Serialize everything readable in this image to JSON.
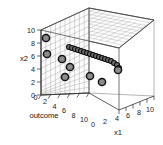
{
  "figure": {
    "type": "3d-scatter",
    "background_color": "#ffffff",
    "box_color": "#3a3a3a",
    "grid_color": "#9a9a9a",
    "point_fill": "#8c8c8c",
    "point_edge": "#141414"
  },
  "axes": {
    "x1": {
      "title": "x1",
      "ticks": [
        "0",
        "2",
        "4",
        "6",
        "8",
        "10"
      ],
      "range": [
        0,
        10
      ]
    },
    "x2": {
      "title": "x2",
      "ticks": [
        "10",
        "8",
        "6",
        "4",
        "2",
        "0"
      ],
      "range": [
        0,
        10
      ]
    },
    "outcome": {
      "title": "outcome",
      "ticks": [
        "0",
        "2",
        "4",
        "6",
        "8",
        "10"
      ],
      "range": [
        0,
        10
      ]
    }
  },
  "chart_data": {
    "type": "scatter",
    "title": "",
    "xlabel": "x1",
    "ylabel": "outcome",
    "zlabel": "x2",
    "xlim": [
      0,
      10
    ],
    "ylim": [
      0,
      10
    ],
    "zlim": [
      0,
      10
    ],
    "grid": true,
    "legend": null,
    "series": [
      {
        "name": "large-markers",
        "marker": "circle-large",
        "points": [
          {
            "x1": 0.4,
            "outcome": 0.5,
            "x2": 7.3
          },
          {
            "x1": 0.5,
            "outcome": 0.6,
            "x2": 4.9
          },
          {
            "x1": 2.1,
            "outcome": 1.4,
            "x2": 4.2
          },
          {
            "x1": 3.0,
            "outcome": 2.1,
            "x2": 3.3
          },
          {
            "x1": 2.4,
            "outcome": 1.7,
            "x2": 1.9
          },
          {
            "x1": 5.6,
            "outcome": 3.6,
            "x2": 2.1
          },
          {
            "x1": 4.6,
            "outcome": 3.2,
            "x2": 1.3
          },
          {
            "x1": 7.4,
            "outcome": 4.8,
            "x2": 3.0
          }
        ]
      },
      {
        "name": "curve-markers",
        "marker": "circle-small",
        "points": [
          {
            "x1": 3.3,
            "outcome": 2.2,
            "x2": 5.9
          },
          {
            "x1": 3.6,
            "outcome": 2.4,
            "x2": 5.8
          },
          {
            "x1": 3.9,
            "outcome": 2.6,
            "x2": 5.7
          },
          {
            "x1": 4.2,
            "outcome": 2.8,
            "x2": 5.6
          },
          {
            "x1": 4.5,
            "outcome": 3.0,
            "x2": 5.4
          },
          {
            "x1": 4.8,
            "outcome": 3.2,
            "x2": 5.3
          },
          {
            "x1": 5.1,
            "outcome": 3.4,
            "x2": 5.1
          },
          {
            "x1": 5.4,
            "outcome": 3.6,
            "x2": 5.0
          },
          {
            "x1": 5.7,
            "outcome": 3.8,
            "x2": 4.8
          },
          {
            "x1": 6.0,
            "outcome": 4.0,
            "x2": 4.6
          },
          {
            "x1": 6.3,
            "outcome": 4.2,
            "x2": 4.5
          },
          {
            "x1": 6.6,
            "outcome": 4.4,
            "x2": 4.3
          },
          {
            "x1": 6.9,
            "outcome": 4.6,
            "x2": 4.1
          },
          {
            "x1": 7.2,
            "outcome": 4.8,
            "x2": 3.9
          },
          {
            "x1": 7.5,
            "outcome": 5.0,
            "x2": 3.7
          },
          {
            "x1": 7.8,
            "outcome": 5.2,
            "x2": 3.5
          },
          {
            "x1": 8.1,
            "outcome": 5.4,
            "x2": 3.3
          },
          {
            "x1": 8.4,
            "outcome": 5.6,
            "x2": 3.1
          }
        ]
      }
    ]
  },
  "rendered": {
    "x2_ticks": [
      {
        "label": "10",
        "x": 36,
        "y": 17
      },
      {
        "label": "8",
        "x": 41,
        "y": 32
      },
      {
        "label": "6",
        "x": 41,
        "y": 47
      },
      {
        "label": "4",
        "x": 41,
        "y": 62
      },
      {
        "label": "2",
        "x": 41,
        "y": 77
      },
      {
        "label": "0",
        "x": 41,
        "y": 92
      }
    ],
    "x2_title": {
      "label": "x2",
      "x": 25,
      "y": 58
    },
    "outcome_ticks": [
      {
        "label": "0",
        "x": 34,
        "y": 95
      },
      {
        "label": "2",
        "x": 43,
        "y": 100
      },
      {
        "label": "4",
        "x": 53,
        "y": 106
      },
      {
        "label": "6",
        "x": 63,
        "y": 112
      },
      {
        "label": "8",
        "x": 73,
        "y": 118
      },
      {
        "label": "10",
        "x": 81,
        "y": 124
      }
    ],
    "outcome_title": {
      "label": "outcome",
      "x": 26,
      "y": 117
    },
    "x1_ticks": [
      {
        "label": "0",
        "x": 91,
        "y": 127
      },
      {
        "label": "2",
        "x": 103,
        "y": 124
      },
      {
        "label": "4",
        "x": 115,
        "y": 121
      },
      {
        "label": "6",
        "x": 127,
        "y": 118
      },
      {
        "label": "8",
        "x": 138,
        "y": 115
      },
      {
        "label": "10",
        "x": 148,
        "y": 112
      }
    ],
    "x1_title": {
      "label": "x1",
      "x": 117,
      "y": 134
    },
    "big_points": [
      {
        "cx": 46,
        "cy": 38,
        "r": 3.6
      },
      {
        "cx": 47,
        "cy": 54,
        "r": 3.6
      },
      {
        "cx": 62,
        "cy": 59,
        "r": 3.6
      },
      {
        "cx": 70,
        "cy": 67,
        "r": 3.6
      },
      {
        "cx": 65,
        "cy": 77,
        "r": 3.6
      },
      {
        "cx": 90,
        "cy": 76,
        "r": 3.6
      },
      {
        "cx": 102,
        "cy": 82,
        "r": 3.6
      },
      {
        "cx": 118,
        "cy": 70,
        "r": 3.6
      }
    ],
    "curve_points": [
      {
        "cx": 69,
        "cy": 47,
        "r": 2.5
      },
      {
        "cx": 72,
        "cy": 48,
        "r": 2.5
      },
      {
        "cx": 75,
        "cy": 49,
        "r": 2.5
      },
      {
        "cx": 78,
        "cy": 50,
        "r": 2.5
      },
      {
        "cx": 81,
        "cy": 51,
        "r": 2.5
      },
      {
        "cx": 84,
        "cy": 52,
        "r": 2.5
      },
      {
        "cx": 87,
        "cy": 53,
        "r": 2.5
      },
      {
        "cx": 90,
        "cy": 54,
        "r": 2.5
      },
      {
        "cx": 93,
        "cy": 55,
        "r": 2.5
      },
      {
        "cx": 96,
        "cy": 56,
        "r": 2.5
      },
      {
        "cx": 99,
        "cy": 57,
        "r": 2.5
      },
      {
        "cx": 102,
        "cy": 58,
        "r": 2.5
      },
      {
        "cx": 105,
        "cy": 59,
        "r": 2.5
      },
      {
        "cx": 108,
        "cy": 60,
        "r": 2.5
      },
      {
        "cx": 111,
        "cy": 61,
        "r": 2.5
      },
      {
        "cx": 114,
        "cy": 63,
        "r": 2.5
      },
      {
        "cx": 117,
        "cy": 65,
        "r": 2.5
      },
      {
        "cx": 119,
        "cy": 68,
        "r": 2.5
      }
    ]
  }
}
